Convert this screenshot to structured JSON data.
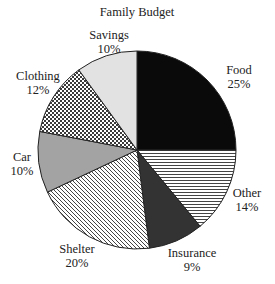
{
  "chart_data": {
    "type": "pie",
    "title": "Family Budget",
    "start_angle": "12 o'clock",
    "direction": "clockwise",
    "slices": [
      {
        "label": "Food",
        "value": 25,
        "display": "25%",
        "fill": "solid",
        "color": "#0a0a0a"
      },
      {
        "label": "Other",
        "value": 14,
        "display": "14%",
        "fill": "horizontal-lines",
        "color": "#ffffff"
      },
      {
        "label": "Insurance",
        "value": 9,
        "display": "9%",
        "fill": "solid",
        "color": "#333333"
      },
      {
        "label": "Shelter",
        "value": 20,
        "display": "20%",
        "fill": "diagonal-lines",
        "color": "#ffffff"
      },
      {
        "label": "Car",
        "value": 10,
        "display": "10%",
        "fill": "solid",
        "color": "#a3a3a3"
      },
      {
        "label": "Clothing",
        "value": 12,
        "display": "12%",
        "fill": "checkerboard",
        "color": "#ffffff"
      },
      {
        "label": "Savings",
        "value": 10,
        "display": "10%",
        "fill": "solid",
        "color": "#e2e2e2"
      }
    ],
    "legend": "none",
    "labels_position": "outside"
  },
  "layout": {
    "cx": 137,
    "cy": 150,
    "r": 99,
    "title_pos": [
      137,
      16
    ],
    "label_pos": {
      "Food": [
        239,
        74
      ],
      "Other": [
        247,
        197
      ],
      "Insurance": [
        192,
        257
      ],
      "Shelter": [
        77,
        253
      ],
      "Car": [
        22,
        161
      ],
      "Clothing": [
        38,
        80
      ],
      "Savings": [
        109,
        39
      ]
    }
  }
}
